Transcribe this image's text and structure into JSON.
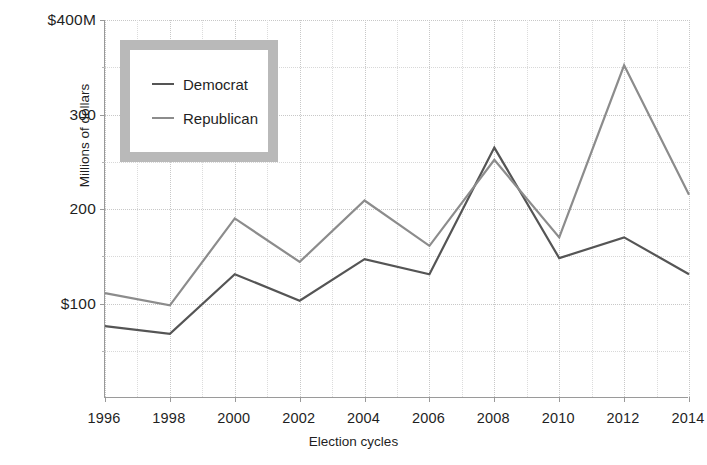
{
  "chart_data": {
    "type": "line",
    "title": "",
    "subtitle": "",
    "xlabel": "Election cycles",
    "ylabel": "Millions of dollars",
    "categories": [
      "1996",
      "1998",
      "2000",
      "2002",
      "2004",
      "2006",
      "2008",
      "2010",
      "2012",
      "2014"
    ],
    "x": [
      1996,
      1998,
      2000,
      2002,
      2004,
      2006,
      2008,
      2010,
      2012,
      2014
    ],
    "xlim": [
      1996,
      2014
    ],
    "ylim": [
      0,
      400
    ],
    "y_ticks": [
      100,
      200,
      300,
      400
    ],
    "y_tick_labels": [
      "$100",
      "200",
      "300",
      "$400M"
    ],
    "y_minor_ticks": [
      50,
      150,
      250,
      350
    ],
    "grid": true,
    "grid_style": "dotted",
    "legend_position": "top-left",
    "series": [
      {
        "name": "Democrat",
        "color": "#555555",
        "values": [
          76,
          68,
          131,
          103,
          147,
          131,
          265,
          148,
          170,
          131
        ]
      },
      {
        "name": "Republican",
        "color": "#8c8c8c",
        "values": [
          111,
          98,
          190,
          144,
          209,
          161,
          252,
          170,
          352,
          215
        ]
      }
    ]
  },
  "legend": {
    "entries": [
      {
        "label": "Democrat",
        "color": "#555555"
      },
      {
        "label": "Republican",
        "color": "#8c8c8c"
      }
    ]
  },
  "axes": {
    "y_title": "Millions of dollars",
    "x_title": "Election cycles"
  }
}
